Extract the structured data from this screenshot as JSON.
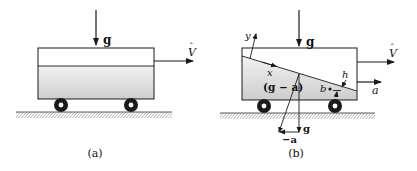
{
  "figure": {
    "panels": [
      {
        "id": "a",
        "caption": "(a)",
        "labels": {
          "gravity": "g",
          "velocity": "V",
          "velocity_accent": "ˆ"
        }
      },
      {
        "id": "b",
        "caption": "(b)",
        "labels": {
          "gravity": "g",
          "velocity": "V",
          "velocity_accent": "ˆ",
          "acceleration": "a",
          "x_axis": "x",
          "y_axis": "y",
          "resultant": "(g − a)",
          "depth": "h",
          "point": "b",
          "gravity_component": "g",
          "neg_accel_component": "−a"
        }
      }
    ],
    "colors": {
      "stroke": "#1a1a1a",
      "liquid_top": "#ececec",
      "liquid_bottom": "#cfcfcf",
      "ground_hatch": "#555555"
    }
  }
}
